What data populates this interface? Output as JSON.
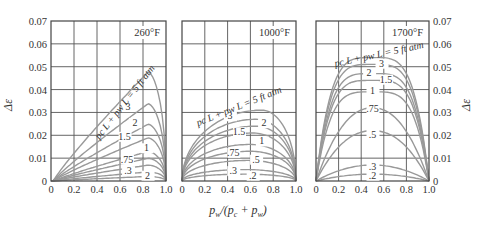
{
  "chart_data": {
    "type": "line",
    "title": "",
    "xlabel": "p_w/(p_c + p_w)",
    "ylabel": "Δε",
    "ylim": [
      0,
      0.07
    ],
    "xlim": [
      0,
      1.0
    ],
    "grid": true,
    "x_ticks": [
      "0",
      "0.2",
      "0.4",
      "0.6",
      "0.8",
      "1.0"
    ],
    "y_ticks": [
      "0",
      "0.01",
      "0.02",
      "0.03",
      "0.04",
      "0.05",
      "0.06",
      "0.07"
    ],
    "curve_family_label": "p_c L + p_w L = 5 ft atm",
    "panels": [
      {
        "title": "260°F",
        "series": [
          {
            "name": "5",
            "peak_x": 0.83,
            "peak_y": 0.048
          },
          {
            "name": "3",
            "peak_x": 0.83,
            "peak_y": 0.034
          },
          {
            "name": "2",
            "peak_x": 0.83,
            "peak_y": 0.025
          },
          {
            "name": "1.5",
            "peak_x": 0.83,
            "peak_y": 0.019
          },
          {
            "name": "1",
            "peak_x": 0.83,
            "peak_y": 0.013
          },
          {
            "name": ".75",
            "peak_x": 0.83,
            "peak_y": 0.01
          },
          {
            "name": ".5",
            "peak_x": 0.83,
            "peak_y": 0.007
          },
          {
            "name": ".3",
            "peak_x": 0.83,
            "peak_y": 0.004
          },
          {
            "name": ".2",
            "peak_x": 0.83,
            "peak_y": 0.002
          }
        ],
        "labels": [
          {
            "text": "3",
            "x": 0.67,
            "y": 0.031
          },
          {
            "text": "2",
            "x": 0.73,
            "y": 0.024
          },
          {
            "text": "1.5",
            "x": 0.64,
            "y": 0.018
          },
          {
            "text": "1",
            "x": 0.83,
            "y": 0.013
          },
          {
            "text": ".75",
            "x": 0.66,
            "y": 0.008
          },
          {
            "text": ".3",
            "x": 0.67,
            "y": 0.003
          },
          {
            "text": "2",
            "x": 0.84,
            "y": 0.001
          }
        ]
      },
      {
        "title": "1000°F",
        "series": [
          {
            "name": "5",
            "peak_x": 0.7,
            "peak_y": 0.031
          },
          {
            "name": "3",
            "peak_x": 0.65,
            "peak_y": 0.027
          },
          {
            "name": "2",
            "peak_x": 0.65,
            "peak_y": 0.024
          },
          {
            "name": "1.5",
            "peak_x": 0.62,
            "peak_y": 0.021
          },
          {
            "name": "1",
            "peak_x": 0.6,
            "peak_y": 0.016
          },
          {
            "name": ".75",
            "peak_x": 0.6,
            "peak_y": 0.013
          },
          {
            "name": ".5",
            "peak_x": 0.58,
            "peak_y": 0.009
          },
          {
            "name": ".3",
            "peak_x": 0.55,
            "peak_y": 0.005
          },
          {
            "name": ".2",
            "peak_x": 0.55,
            "peak_y": 0.003
          }
        ],
        "labels": [
          {
            "text": "3",
            "x": 0.42,
            "y": 0.027
          },
          {
            "text": "2",
            "x": 0.72,
            "y": 0.024
          },
          {
            "text": "1.5",
            "x": 0.5,
            "y": 0.02
          },
          {
            "text": "1",
            "x": 0.7,
            "y": 0.016
          },
          {
            "text": ".75",
            "x": 0.45,
            "y": 0.011
          },
          {
            "text": ".5",
            "x": 0.65,
            "y": 0.008
          },
          {
            "text": ".3",
            "x": 0.45,
            "y": 0.003
          },
          {
            "text": ".2",
            "x": 0.62,
            "y": 0.001
          }
        ]
      },
      {
        "title": "1700°F",
        "series": [
          {
            "name": "5",
            "peak_x": 0.5,
            "peak_y": 0.054
          },
          {
            "name": "3",
            "peak_x": 0.5,
            "peak_y": 0.051
          },
          {
            "name": "2",
            "peak_x": 0.5,
            "peak_y": 0.047
          },
          {
            "name": "1.5",
            "peak_x": 0.5,
            "peak_y": 0.044
          },
          {
            "name": "1",
            "peak_x": 0.5,
            "peak_y": 0.039
          },
          {
            "name": ".75",
            "peak_x": 0.5,
            "peak_y": 0.032
          },
          {
            "name": ".5",
            "peak_x": 0.5,
            "peak_y": 0.022
          },
          {
            "name": ".3",
            "peak_x": 0.5,
            "peak_y": 0.007
          },
          {
            "name": ".2",
            "peak_x": 0.5,
            "peak_y": 0.003
          }
        ],
        "labels": [
          {
            "text": "3",
            "x": 0.58,
            "y": 0.05
          },
          {
            "text": "2",
            "x": 0.47,
            "y": 0.046
          },
          {
            "text": "1.5",
            "x": 0.62,
            "y": 0.043
          },
          {
            "text": "1",
            "x": 0.5,
            "y": 0.038
          },
          {
            "text": ".75",
            "x": 0.5,
            "y": 0.03
          },
          {
            "text": ".5",
            "x": 0.5,
            "y": 0.019
          },
          {
            "text": ".3",
            "x": 0.5,
            "y": 0.005
          },
          {
            "text": ".2",
            "x": 0.5,
            "y": 0.001
          }
        ]
      }
    ]
  },
  "axes": {
    "ylabel": "Δε",
    "xlabel": "p_w/(p_c + p_w)"
  }
}
